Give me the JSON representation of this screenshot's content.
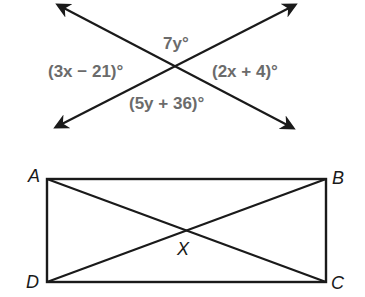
{
  "figure1": {
    "title": "Intersecting lines",
    "labels": {
      "top": "7y°",
      "left": "(3x − 21)°",
      "right": "(2x + 4)°",
      "bottom": "(5y + 36)°"
    },
    "label_color": "#6b6b6b",
    "line_color": "#1a1a1a"
  },
  "figure2": {
    "title": "Rectangle ABCD with diagonals",
    "vertices": {
      "A": "A",
      "B": "B",
      "C": "C",
      "D": "D",
      "X": "X"
    },
    "line_color": "#1a1a1a"
  }
}
